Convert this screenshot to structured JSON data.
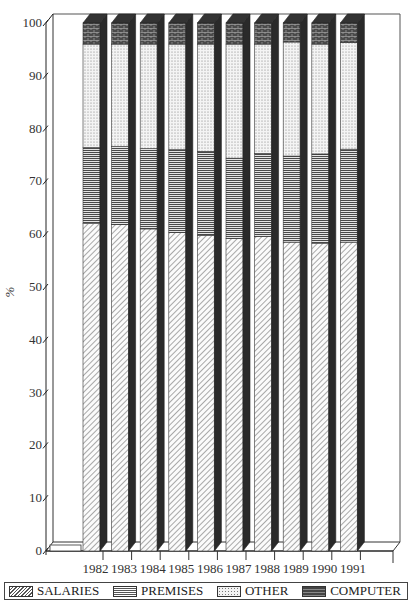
{
  "chart_data": {
    "type": "bar",
    "stacked": true,
    "style": "3d-stacked-percent",
    "title": "",
    "xlabel": "",
    "ylabel": "%",
    "ylim": [
      0,
      100
    ],
    "yticks": [
      0,
      10,
      20,
      30,
      40,
      50,
      60,
      70,
      80,
      90,
      100
    ],
    "grid": false,
    "legend_position": "bottom",
    "categories": [
      "1982",
      "1983",
      "1984",
      "1985",
      "1986",
      "1987",
      "1988",
      "1989",
      "1990",
      "1991"
    ],
    "series": [
      {
        "name": "SALARIES",
        "values": [
          62.0,
          61.8,
          61.0,
          60.3,
          59.8,
          59.2,
          59.6,
          58.5,
          58.3,
          58.5
        ]
      },
      {
        "name": "PREMISES",
        "values": [
          14.4,
          14.8,
          15.2,
          15.7,
          15.9,
          15.2,
          15.7,
          16.3,
          16.9,
          17.6
        ]
      },
      {
        "name": "OTHER",
        "values": [
          19.6,
          19.4,
          19.8,
          20.0,
          20.3,
          21.6,
          20.7,
          21.6,
          20.8,
          20.2
        ]
      },
      {
        "name": "COMPUTER",
        "values": [
          4.0,
          4.0,
          4.0,
          4.0,
          4.0,
          4.0,
          4.0,
          3.6,
          4.0,
          3.7
        ]
      }
    ]
  },
  "legend": {
    "items": [
      {
        "label": "SALARIES",
        "pattern": "diagonal-hatch"
      },
      {
        "label": "PREMISES",
        "pattern": "horizontal-lines"
      },
      {
        "label": "OTHER",
        "pattern": "dots"
      },
      {
        "label": "COMPUTER",
        "pattern": "dark-brick"
      }
    ]
  },
  "axis": {
    "y_label": "%"
  }
}
